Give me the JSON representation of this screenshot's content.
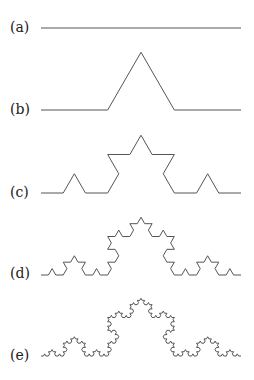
{
  "figure": {
    "stroke_color": "#555555",
    "panels": [
      {
        "label": "(a)",
        "iteration": 0,
        "x0": 41,
        "x1": 241,
        "base_y": 28,
        "label_y": 20
      },
      {
        "label": "(b)",
        "iteration": 1,
        "x0": 41,
        "x1": 241,
        "base_y": 110,
        "label_y": 102
      },
      {
        "label": "(c)",
        "iteration": 2,
        "x0": 41,
        "x1": 241,
        "base_y": 193,
        "label_y": 185
      },
      {
        "label": "(d)",
        "iteration": 3,
        "x0": 41,
        "x1": 241,
        "base_y": 275,
        "label_y": 266
      },
      {
        "label": "(e)",
        "iteration": 4,
        "x0": 41,
        "x1": 241,
        "base_y": 356,
        "label_y": 348
      }
    ]
  }
}
